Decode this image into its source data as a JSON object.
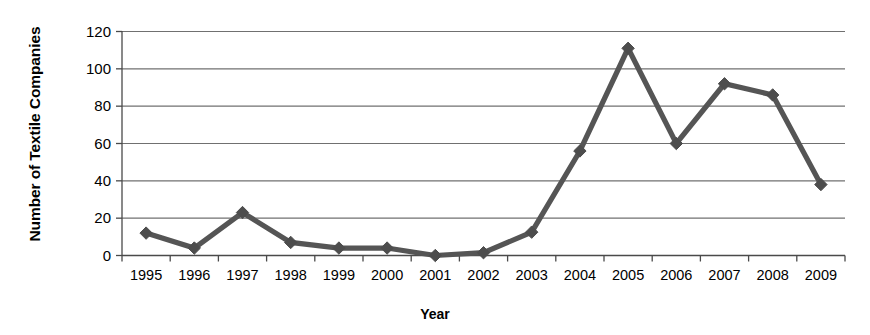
{
  "chart_data": {
    "type": "line",
    "title": "",
    "xlabel": "Year",
    "ylabel": "Number of Textile Companies",
    "categories": [
      "1995",
      "1996",
      "1997",
      "1998",
      "1999",
      "2000",
      "2001",
      "2002",
      "2003",
      "2004",
      "2005",
      "2006",
      "2007",
      "2008",
      "2009"
    ],
    "values": [
      12,
      4,
      23,
      7,
      4,
      4,
      0,
      1.5,
      12.5,
      56,
      111,
      60,
      92,
      86,
      38
    ],
    "x": [
      1995,
      1996,
      1997,
      1998,
      1999,
      2000,
      2001,
      2002,
      2003,
      2004,
      2005,
      2006,
      2007,
      2008,
      2009
    ],
    "ylim": [
      0,
      120
    ],
    "yticks": [
      0,
      20,
      40,
      60,
      80,
      100,
      120
    ],
    "ytick_labels": [
      "0",
      "20",
      "40",
      "60",
      "80",
      "100",
      "120"
    ],
    "grid": true,
    "grid_axis": "y",
    "legend": false,
    "legend_position": "none",
    "marker": "diamond",
    "series": [
      {
        "name": "Number of Textile Companies",
        "values": [
          12,
          4,
          23,
          7,
          4,
          4,
          0,
          1.5,
          12.5,
          56,
          111,
          60,
          92,
          86,
          38
        ]
      }
    ],
    "colors": {
      "line": "#555555",
      "marker": "#4d4d4d",
      "grid": "#707070",
      "axis": "#4a4a4a",
      "text": "#000000",
      "background": "#ffffff"
    }
  }
}
